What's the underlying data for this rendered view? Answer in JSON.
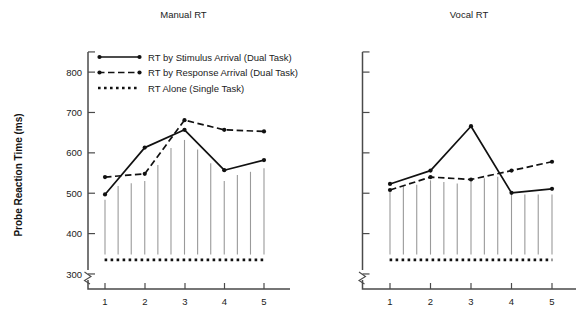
{
  "figure": {
    "y_axis_label": "Probe Reaction Time (ms)",
    "panels": [
      {
        "id": "manual",
        "title": "Manual RT"
      },
      {
        "id": "vocal",
        "title": "Vocal RT"
      }
    ]
  },
  "legend": {
    "items": [
      {
        "key": "stimulus",
        "label": "RT by Stimulus Arrival (Dual Task)",
        "style": "solid-line-with-markers"
      },
      {
        "key": "response",
        "label": "RT by Response Arrival (Dual Task)",
        "style": "dashed-line-with-markers"
      },
      {
        "key": "alone",
        "label": "RT Alone (Single Task)",
        "style": "dotted-line"
      }
    ]
  },
  "axes": {
    "y_ticks": [
      "300",
      "400",
      "500",
      "600",
      "700",
      "800"
    ],
    "x_ticks": [
      "1",
      "2",
      "3",
      "4",
      "5"
    ],
    "y_min": 290,
    "y_max": 830,
    "x_min": 0.45,
    "x_max": 5.6
  },
  "chart_data": {
    "type": "line",
    "xlabel": "",
    "ylabel": "Probe Reaction Time (ms)",
    "ylim": [
      290,
      830
    ],
    "y_ticks": [
      300,
      400,
      500,
      600,
      700,
      800
    ],
    "x_ticks": [
      1,
      2,
      3,
      4,
      5
    ],
    "grid": false,
    "legend_position": "top-left (inside Manual RT panel)",
    "panels": [
      {
        "name": "Manual RT",
        "x": [
          1,
          2,
          3,
          4,
          5
        ],
        "series": [
          {
            "name": "RT by Stimulus Arrival (Dual Task)",
            "style": "solid",
            "values": [
              497,
              613,
              657,
              557,
              582
            ]
          },
          {
            "name": "RT by Response Arrival (Dual Task)",
            "style": "dashed",
            "values": [
              540,
              548,
              681,
              657,
              653
            ]
          },
          {
            "name": "RT Alone (Single Task)",
            "style": "dotted",
            "value": 335
          }
        ],
        "drop_lines": {
          "count": 13,
          "base": 335,
          "x_positions": [
            1.0,
            1.33,
            1.66,
            2.0,
            2.33,
            2.66,
            3.0,
            3.33,
            3.66,
            4.0,
            4.33,
            4.66,
            5.0
          ],
          "tops": [
            484,
            518,
            525,
            530,
            570,
            612,
            632,
            608,
            574,
            530,
            545,
            553,
            562
          ]
        }
      },
      {
        "name": "Vocal RT",
        "x": [
          1,
          2,
          3,
          4,
          5
        ],
        "series": [
          {
            "name": "RT by Stimulus Arrival (Dual Task)",
            "style": "solid",
            "values": [
              523,
              556,
              666,
              501,
              511
            ]
          },
          {
            "name": "RT by Response Arrival (Dual Task)",
            "style": "dashed",
            "values": [
              508,
              540,
              534,
              556,
              578
            ]
          },
          {
            "name": "RT Alone (Single Task)",
            "style": "dotted",
            "value": 335
          }
        ],
        "drop_lines": {
          "count": 13,
          "base": 335,
          "x_positions": [
            1.0,
            1.33,
            1.66,
            2.0,
            2.33,
            2.66,
            3.0,
            3.33,
            3.66,
            4.0,
            4.33,
            4.66,
            5.0
          ],
          "tops": [
            505,
            518,
            521,
            532,
            528,
            524,
            531,
            537,
            541,
            497,
            497,
            497,
            497
          ]
        }
      }
    ]
  },
  "colors": {
    "line": "#111111",
    "drop_line": "#9a9a9a",
    "axis": "#4a4a4a",
    "text": "#222222",
    "background": "#ffffff"
  }
}
